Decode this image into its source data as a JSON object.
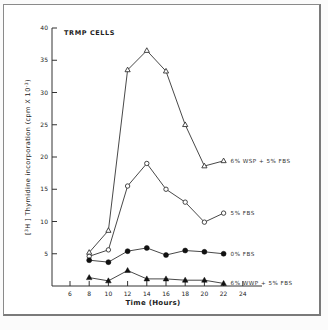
{
  "chart_data": {
    "type": "line",
    "title": "TRMP CELLS",
    "xlabel": "Time (Hours)",
    "ylabel": "[3H] Thymidine incorporation (cpm X 10^-3)",
    "ylabel_parts": {
      "pre": "[",
      "sup1": "3",
      "mid": "H ] Thymidine incorporation (cpm X 10",
      "sup2": "-3",
      "post": ")"
    },
    "x_ticks": [
      6,
      8,
      10,
      12,
      14,
      16,
      18,
      20,
      22,
      24
    ],
    "y_ticks": [
      5,
      10,
      15,
      20,
      25,
      30,
      35,
      40
    ],
    "xlim": [
      4,
      26
    ],
    "ylim": [
      0,
      40
    ],
    "grid": false,
    "legend_position": "inline-right",
    "x": [
      8,
      10,
      12,
      14,
      16,
      18,
      20,
      22
    ],
    "series": [
      {
        "name": "6% WSP + 5% FBS",
        "marker": "open-triangle",
        "values": [
          5.2,
          8.6,
          33.5,
          36.5,
          33.3,
          25.0,
          18.6,
          19.4
        ],
        "label_y": 19.4
      },
      {
        "name": "5% FBS",
        "marker": "open-circle",
        "values": [
          4.6,
          5.6,
          15.5,
          19.0,
          15.0,
          13.0,
          9.9,
          11.3
        ],
        "label_y": 11.3
      },
      {
        "name": "0% FBS",
        "marker": "filled-circle",
        "values": [
          4.0,
          3.7,
          5.4,
          5.9,
          4.8,
          5.5,
          5.3,
          5.0
        ],
        "label_y": 5.0
      },
      {
        "name": "6% WWP + 5% FBS",
        "marker": "filled-triangle",
        "values": [
          1.3,
          0.8,
          2.4,
          1.1,
          1.1,
          0.9,
          0.9,
          0.4
        ],
        "label_y": 0.4
      }
    ]
  }
}
